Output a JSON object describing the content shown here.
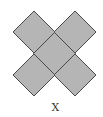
{
  "figure": {
    "label": "X",
    "fill_color": "#b5b5b5",
    "stroke_color": "#4a4a4a",
    "shape": "five rotated squares (diamonds) arranged as an X",
    "tiles": [
      {
        "name": "top-left",
        "cx": 34,
        "cy": 32
      },
      {
        "name": "top-right",
        "cx": 75,
        "cy": 32
      },
      {
        "name": "center",
        "cx": 54.5,
        "cy": 53.5
      },
      {
        "name": "bottom-left",
        "cx": 34,
        "cy": 75
      },
      {
        "name": "bottom-right",
        "cx": 75,
        "cy": 75
      }
    ],
    "half_diagonal": 21
  }
}
